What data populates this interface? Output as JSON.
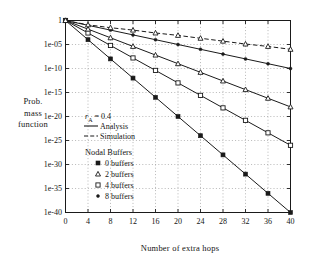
{
  "chart_data": {
    "type": "line",
    "title": "",
    "xlabel": "Number of extra hops",
    "ylabel_lines": [
      "Prob.",
      "mass",
      "function"
    ],
    "ylabel": "Prob. mass function",
    "xlim": [
      0,
      40
    ],
    "ylim_exponent": [
      -40,
      0
    ],
    "yscale": "log",
    "xticks": [
      0,
      4,
      8,
      12,
      16,
      20,
      24,
      28,
      32,
      36,
      40
    ],
    "xtick_labels": [
      "0",
      "4",
      "8",
      "12",
      "16",
      "20",
      "24",
      "28",
      "32",
      "36",
      "40"
    ],
    "yticks_exponent": [
      0,
      -5,
      -10,
      -15,
      -20,
      -25,
      -30,
      -35,
      -40
    ],
    "ytick_labels": [
      "1",
      "1e-05",
      "1e-10",
      "1e-15",
      "1e-20",
      "1e-25",
      "1e-30",
      "1e-35",
      "1e-40"
    ],
    "grid": "dotted",
    "legend_position": "middle-left-inside",
    "annotations": {
      "parameter": "r",
      "parameter_sub": "A",
      "parameter_value": "= 0.4",
      "parameter_full": "r_A = 0.4"
    },
    "line_style_legend": [
      {
        "label": "Analysis",
        "style": "solid"
      },
      {
        "label": "Simulation",
        "style": "dashed"
      }
    ],
    "marker_legend_title": "Nodal Buffers",
    "marker_legend": [
      {
        "label": "0 buffers",
        "marker": "filled-square"
      },
      {
        "label": "2 buffers",
        "marker": "triangle"
      },
      {
        "label": "4 buffers",
        "marker": "open-square"
      },
      {
        "label": "8 buffers",
        "marker": "filled-dot"
      }
    ],
    "x": [
      0,
      4,
      8,
      12,
      16,
      20,
      24,
      28,
      32,
      36,
      40
    ],
    "series": [
      {
        "name": "0 buffers",
        "style": "solid",
        "marker": "filled-square",
        "values_exponent": [
          0,
          -4,
          -8,
          -12,
          -16,
          -20,
          -24,
          -28,
          -32,
          -36,
          -40
        ]
      },
      {
        "name": "2 buffers",
        "style": "solid",
        "marker": "open-square",
        "values_exponent": [
          0,
          -2.6,
          -5.2,
          -7.8,
          -10.4,
          -13.0,
          -15.6,
          -18.2,
          -20.8,
          -23.4,
          -26.0
        ]
      },
      {
        "name": "4 buffers",
        "style": "solid",
        "marker": "triangle",
        "values_exponent": [
          0,
          -1.8,
          -3.6,
          -5.4,
          -7.2,
          -9.0,
          -10.8,
          -12.6,
          -14.4,
          -16.2,
          -18.0
        ]
      },
      {
        "name": "8 buffers (analysis)",
        "style": "solid",
        "marker": "filled-dot",
        "values_exponent": [
          0,
          -1.0,
          -2.0,
          -3.0,
          -4.0,
          -5.0,
          -6.0,
          -7.0,
          -8.0,
          -9.0,
          -10.0
        ]
      },
      {
        "name": "8 buffers (simulation)",
        "style": "dashed",
        "marker": "triangle",
        "values_exponent": [
          0,
          -0.9,
          -1.5,
          -2.0,
          -2.6,
          -3.1,
          -3.7,
          -4.3,
          -4.9,
          -5.4,
          -6.0
        ]
      }
    ],
    "colors": {
      "line": "#1a1a1a",
      "grid": "#9a9a9a",
      "axis": "#1a1a1a",
      "background": "#ffffff"
    }
  }
}
